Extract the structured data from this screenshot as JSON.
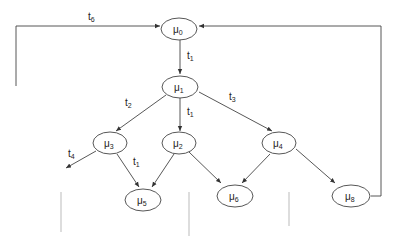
{
  "diagram": {
    "type": "state-transition-graph",
    "nodes": [
      {
        "id": "mu0",
        "symbol": "μ",
        "sub": "0",
        "cx": 179,
        "cy": 29
      },
      {
        "id": "mu1",
        "symbol": "μ",
        "sub": "1",
        "cx": 180,
        "cy": 87
      },
      {
        "id": "mu3",
        "symbol": "μ",
        "sub": "3",
        "cx": 110,
        "cy": 143
      },
      {
        "id": "mu2",
        "symbol": "μ",
        "sub": "2",
        "cx": 179,
        "cy": 143
      },
      {
        "id": "mu4",
        "symbol": "μ",
        "sub": "4",
        "cx": 279,
        "cy": 143
      },
      {
        "id": "mu5",
        "symbol": "μ",
        "sub": "5",
        "cx": 143,
        "cy": 200
      },
      {
        "id": "mu6",
        "symbol": "μ",
        "sub": "6",
        "cx": 235,
        "cy": 196
      },
      {
        "id": "mu8",
        "symbol": "μ",
        "sub": "8",
        "cx": 351,
        "cy": 196
      }
    ],
    "edges": [
      {
        "from": "mu0",
        "to": "mu1",
        "label": "t",
        "label_sub": "1"
      },
      {
        "from": "mu1",
        "to": "mu3",
        "label": "t",
        "label_sub": "2"
      },
      {
        "from": "mu1",
        "to": "mu2",
        "label": "t",
        "label_sub": "1"
      },
      {
        "from": "mu1",
        "to": "mu4",
        "label": "t",
        "label_sub": "3"
      },
      {
        "from": "mu3",
        "to": "out",
        "label": "t",
        "label_sub": "4"
      },
      {
        "from": "mu3",
        "to": "mu5",
        "label": "t",
        "label_sub": "1"
      },
      {
        "from": "mu2",
        "to": "mu5",
        "label": "",
        "label_sub": ""
      },
      {
        "from": "mu2",
        "to": "mu6",
        "label": "",
        "label_sub": ""
      },
      {
        "from": "mu4",
        "to": "mu6",
        "label": "",
        "label_sub": ""
      },
      {
        "from": "mu4",
        "to": "mu8",
        "label": "",
        "label_sub": ""
      },
      {
        "from": "left-loop",
        "to": "mu0",
        "label": "t",
        "label_sub": "6"
      },
      {
        "from": "mu8",
        "to": "mu0",
        "label": "",
        "label_sub": ""
      }
    ]
  },
  "labels": {
    "mu0": {
      "s": "μ",
      "sub": "0"
    },
    "mu1": {
      "s": "μ",
      "sub": "1"
    },
    "mu2": {
      "s": "μ",
      "sub": "2"
    },
    "mu3": {
      "s": "μ",
      "sub": "3"
    },
    "mu4": {
      "s": "μ",
      "sub": "4"
    },
    "mu5": {
      "s": "μ",
      "sub": "5"
    },
    "mu6": {
      "s": "μ",
      "sub": "6"
    },
    "mu8": {
      "s": "μ",
      "sub": "8"
    },
    "t6": {
      "s": "t",
      "sub": "6"
    },
    "t1_top": {
      "s": "t",
      "sub": "1"
    },
    "t2": {
      "s": "t",
      "sub": "2"
    },
    "t1_mid": {
      "s": "t",
      "sub": "1"
    },
    "t3": {
      "s": "t",
      "sub": "3"
    },
    "t4": {
      "s": "t",
      "sub": "4"
    },
    "t1_low": {
      "s": "t",
      "sub": "1"
    }
  }
}
